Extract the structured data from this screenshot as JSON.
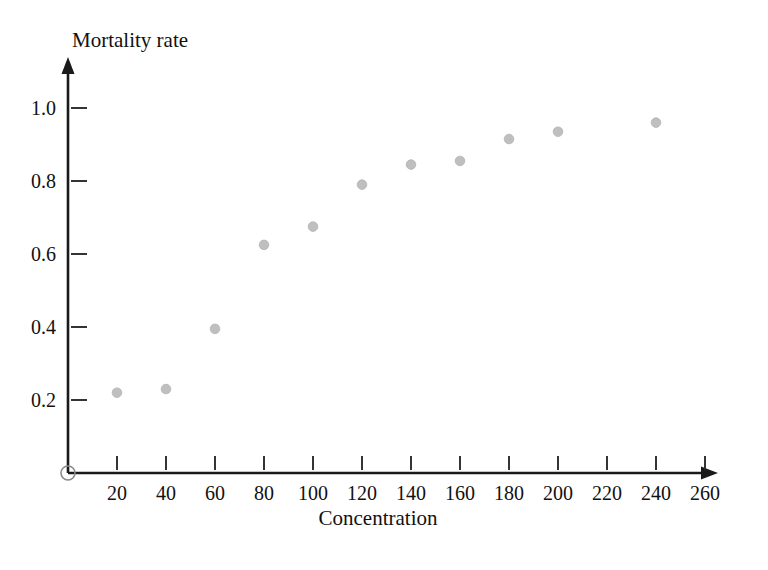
{
  "chart_data": {
    "type": "scatter",
    "title": "",
    "xlabel": "Concentration",
    "ylabel": "Mortality rate",
    "x": [
      20,
      40,
      60,
      80,
      100,
      120,
      140,
      160,
      180,
      200,
      240
    ],
    "values": [
      0.22,
      0.23,
      0.395,
      0.625,
      0.675,
      0.79,
      0.845,
      0.855,
      0.915,
      0.935,
      0.96
    ],
    "points": [
      {
        "x": 20,
        "y": 0.22
      },
      {
        "x": 40,
        "y": 0.23
      },
      {
        "x": 60,
        "y": 0.395
      },
      {
        "x": 80,
        "y": 0.625
      },
      {
        "x": 100,
        "y": 0.675
      },
      {
        "x": 120,
        "y": 0.79
      },
      {
        "x": 140,
        "y": 0.845
      },
      {
        "x": 160,
        "y": 0.855
      },
      {
        "x": 180,
        "y": 0.915
      },
      {
        "x": 200,
        "y": 0.935
      },
      {
        "x": 240,
        "y": 0.96
      }
    ],
    "xticks": [
      20,
      40,
      60,
      80,
      100,
      120,
      140,
      160,
      180,
      200,
      220,
      240,
      260
    ],
    "xtick_labels": [
      "20",
      "40",
      "60",
      "80",
      "100",
      "120",
      "140",
      "160",
      "180",
      "200",
      "220",
      "240",
      "260"
    ],
    "yticks": [
      0.2,
      0.4,
      0.6,
      0.8,
      1.0
    ],
    "ytick_labels": [
      "0.2",
      "0.4",
      "0.6",
      "0.8",
      "1.0"
    ],
    "xlim": [
      0,
      270
    ],
    "ylim": [
      0,
      1.08
    ],
    "grid": false,
    "legend": null,
    "marker_color": "#bfbfbf",
    "axis_color": "#1a1a1a",
    "background_color": "#ffffff",
    "origin_marker": "open-circle"
  }
}
